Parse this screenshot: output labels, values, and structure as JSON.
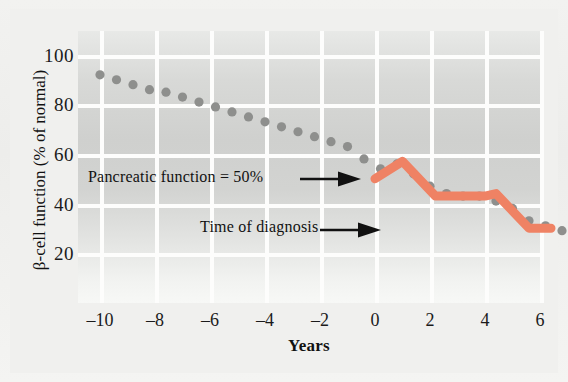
{
  "figure": {
    "background_color": "#f0f0ee",
    "plot_background": "#d6d7d5"
  },
  "chart_data": {
    "type": "scatter",
    "title": "",
    "xlabel": "Years",
    "ylabel": "β-cell function (% of normal)",
    "xlim": [
      -11,
      7.5
    ],
    "ylim": [
      10,
      108
    ],
    "xticks": [
      "–10",
      "–8",
      "–6",
      "–4",
      "–2",
      "0",
      "2",
      "4",
      "6"
    ],
    "xtick_values": [
      -10,
      -8,
      -6,
      -4,
      -2,
      0,
      2,
      4,
      6
    ],
    "yticks": [
      "100",
      "80",
      "60",
      "40",
      "20"
    ],
    "ytick_values": [
      100,
      80,
      60,
      40,
      20
    ],
    "grid": true,
    "legend": "none",
    "series": [
      {
        "name": "beta-cell function (observed points)",
        "type": "scatter",
        "marker": "circle",
        "color": "#8e8f8d",
        "x": [
          -10.0,
          -9.4,
          -8.8,
          -8.2,
          -7.6,
          -7.0,
          -6.4,
          -5.8,
          -5.2,
          -4.6,
          -4.0,
          -3.4,
          -2.8,
          -2.2,
          -1.6,
          -1.0,
          -0.4,
          0.2,
          0.8,
          1.4,
          2.0,
          2.6,
          3.2,
          3.8,
          4.4,
          5.0,
          5.6,
          6.2,
          6.8
        ],
        "y": [
          92,
          90,
          88,
          86,
          85,
          83,
          81,
          79,
          77,
          75,
          73,
          71,
          69,
          67,
          65,
          63,
          58,
          54,
          56,
          52,
          47,
          44,
          43,
          43,
          41,
          38,
          33,
          31,
          29
        ]
      },
      {
        "name": "β-cell function trend after diagnosis",
        "type": "line",
        "color": "#ef8264",
        "x": [
          0.0,
          1.0,
          2.2,
          4.0,
          4.4,
          5.6,
          6.4
        ],
        "y": [
          50,
          57,
          43,
          43,
          44,
          30,
          30
        ]
      }
    ],
    "annotations": [
      {
        "id": "pancreatic-function",
        "text": "Pancreatic function = 50%",
        "arrow": true,
        "points_to": {
          "x": 0.0,
          "y": 50
        }
      },
      {
        "id": "time-of-diagnosis",
        "text": "Time of diagnosis",
        "arrow": true,
        "points_to": {
          "x": 0.0,
          "y": 36
        }
      }
    ]
  },
  "colors": {
    "marker_grey": "#8e8f8d",
    "line_orange": "#ef8264",
    "gridline": "#fdfdfc",
    "text": "#111111"
  }
}
